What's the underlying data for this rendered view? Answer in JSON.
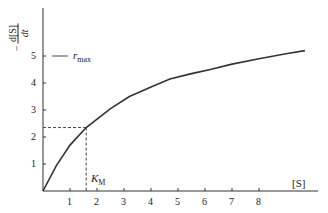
{
  "chart_data": {
    "type": "line",
    "title": "",
    "xlabel": "[S]",
    "ylabel": "-d[S]/dt",
    "xlim": [
      0,
      10
    ],
    "ylim": [
      0,
      6.7
    ],
    "x_ticks": [
      "1",
      "2",
      "3",
      "4",
      "5",
      "6",
      "7",
      "8"
    ],
    "y_ticks": [
      "1",
      "2",
      "3",
      "4",
      "5"
    ],
    "grid": false,
    "series": [
      {
        "name": "rate curve",
        "x": [
          0,
          0.5,
          1.0,
          1.6,
          2.5,
          3.2,
          4.0,
          4.7,
          5.5,
          6.2,
          7.0,
          8.0,
          9.0,
          9.7
        ],
        "y": [
          0,
          0.95,
          1.7,
          2.35,
          3.05,
          3.5,
          3.85,
          4.15,
          4.35,
          4.5,
          4.7,
          4.9,
          5.08,
          5.2
        ]
      }
    ],
    "annotations": [
      {
        "text": "r_max",
        "y": 5,
        "style": "short horizontal marker at y=5"
      },
      {
        "text": "K_M",
        "x": 1.6,
        "y": 2.35,
        "style": "dashed guide lines from curve to both axes"
      }
    ]
  },
  "labels": {
    "y_num": "d[S]",
    "y_den": "dt",
    "y_sign": "−",
    "x_axis": "[S]",
    "rmax_main": "r",
    "rmax_sub": "max",
    "km_main": "K",
    "km_sub": "M"
  }
}
